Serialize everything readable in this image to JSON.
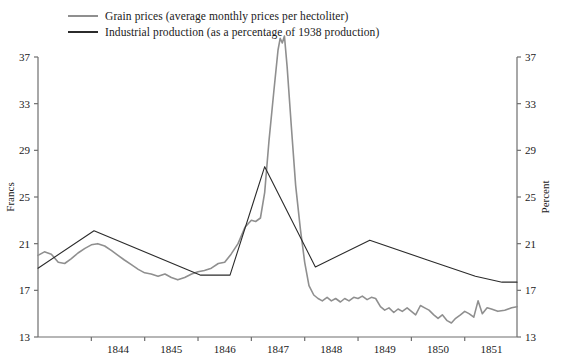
{
  "chart_data": {
    "type": "line",
    "title": "",
    "xlabel": "",
    "ylabel": "Francs",
    "y2label": "Percent",
    "xlim": [
      1843.0,
      1851.98
    ],
    "ylim": [
      13,
      37
    ],
    "y2lim": [
      13,
      37
    ],
    "grid": false,
    "legend_position": "top-left",
    "x_ticks": [
      1844,
      1845,
      1846,
      1847,
      1848,
      1849,
      1850,
      1851
    ],
    "x_tick_labels": [
      "1844",
      "1845",
      "1846",
      "1847",
      "1848",
      "1849",
      "1850",
      "1851"
    ],
    "y_ticks": [
      13,
      17,
      21,
      25,
      29,
      33,
      37
    ],
    "y_tick_labels": [
      "13",
      "17",
      "21",
      "25",
      "29",
      "33",
      "37"
    ],
    "y2_ticks": [
      13,
      17,
      21,
      25,
      29,
      33,
      37
    ],
    "y2_tick_labels": [
      "13",
      "17",
      "21",
      "25",
      "29",
      "33",
      "37"
    ],
    "series": [
      {
        "name": "Grain prices (average monthly prices per hectoliter)",
        "short_name": "grain-prices",
        "color": "#8f8f8f",
        "axis": "left",
        "unit": "francs",
        "points": [
          [
            1843.0,
            20.0
          ],
          [
            1843.12,
            20.3
          ],
          [
            1843.25,
            20.1
          ],
          [
            1843.38,
            19.4
          ],
          [
            1843.5,
            19.3
          ],
          [
            1843.62,
            19.7
          ],
          [
            1843.75,
            20.2
          ],
          [
            1843.88,
            20.6
          ],
          [
            1844.0,
            20.9
          ],
          [
            1844.12,
            21.0
          ],
          [
            1844.25,
            20.8
          ],
          [
            1844.38,
            20.4
          ],
          [
            1844.5,
            20.0
          ],
          [
            1844.62,
            19.6
          ],
          [
            1844.75,
            19.2
          ],
          [
            1844.88,
            18.8
          ],
          [
            1845.0,
            18.5
          ],
          [
            1845.12,
            18.4
          ],
          [
            1845.25,
            18.2
          ],
          [
            1845.38,
            18.4
          ],
          [
            1845.5,
            18.1
          ],
          [
            1845.62,
            17.9
          ],
          [
            1845.75,
            18.1
          ],
          [
            1845.88,
            18.4
          ],
          [
            1846.0,
            18.6
          ],
          [
            1846.12,
            18.7
          ],
          [
            1846.25,
            18.9
          ],
          [
            1846.38,
            19.3
          ],
          [
            1846.5,
            19.4
          ],
          [
            1846.62,
            20.1
          ],
          [
            1846.75,
            21.0
          ],
          [
            1846.88,
            22.4
          ],
          [
            1847.0,
            23.0
          ],
          [
            1847.08,
            22.9
          ],
          [
            1847.17,
            23.2
          ],
          [
            1847.25,
            25.4
          ],
          [
            1847.33,
            29.8
          ],
          [
            1847.42,
            34.0
          ],
          [
            1847.5,
            37.6
          ],
          [
            1847.54,
            38.6
          ],
          [
            1847.58,
            38.2
          ],
          [
            1847.62,
            38.8
          ],
          [
            1847.67,
            36.2
          ],
          [
            1847.75,
            31.0
          ],
          [
            1847.83,
            26.0
          ],
          [
            1847.92,
            22.2
          ],
          [
            1848.0,
            19.4
          ],
          [
            1848.08,
            17.4
          ],
          [
            1848.17,
            16.6
          ],
          [
            1848.25,
            16.3
          ],
          [
            1848.33,
            16.1
          ],
          [
            1848.42,
            16.4
          ],
          [
            1848.5,
            16.1
          ],
          [
            1848.58,
            16.3
          ],
          [
            1848.67,
            16.0
          ],
          [
            1848.75,
            16.3
          ],
          [
            1848.83,
            16.1
          ],
          [
            1848.92,
            16.4
          ],
          [
            1849.0,
            16.3
          ],
          [
            1849.08,
            16.5
          ],
          [
            1849.17,
            16.2
          ],
          [
            1849.25,
            16.4
          ],
          [
            1849.33,
            16.3
          ],
          [
            1849.42,
            15.6
          ],
          [
            1849.5,
            15.3
          ],
          [
            1849.58,
            15.5
          ],
          [
            1849.67,
            15.1
          ],
          [
            1849.75,
            15.4
          ],
          [
            1849.83,
            15.2
          ],
          [
            1849.92,
            15.5
          ],
          [
            1850.0,
            15.2
          ],
          [
            1850.08,
            14.9
          ],
          [
            1850.17,
            15.7
          ],
          [
            1850.25,
            15.5
          ],
          [
            1850.33,
            15.3
          ],
          [
            1850.42,
            14.9
          ],
          [
            1850.5,
            14.6
          ],
          [
            1850.58,
            14.9
          ],
          [
            1850.67,
            14.4
          ],
          [
            1850.75,
            14.2
          ],
          [
            1850.83,
            14.6
          ],
          [
            1850.92,
            14.9
          ],
          [
            1851.0,
            15.2
          ],
          [
            1851.08,
            15.0
          ],
          [
            1851.17,
            14.7
          ],
          [
            1851.25,
            16.1
          ],
          [
            1851.33,
            15.0
          ],
          [
            1851.42,
            15.5
          ],
          [
            1851.5,
            15.4
          ],
          [
            1851.62,
            15.2
          ],
          [
            1851.75,
            15.3
          ],
          [
            1851.88,
            15.5
          ],
          [
            1851.98,
            15.6
          ]
        ]
      },
      {
        "name": "Industrial production (as a percentage of 1938 production)",
        "short_name": "industrial-production",
        "color": "#2b2b2b",
        "axis": "right",
        "unit": "percent",
        "points": [
          [
            1843.0,
            18.9
          ],
          [
            1844.05,
            22.1
          ],
          [
            1846.05,
            18.3
          ],
          [
            1846.6,
            18.3
          ],
          [
            1847.25,
            27.6
          ],
          [
            1848.2,
            19.0
          ],
          [
            1849.22,
            21.3
          ],
          [
            1850.3,
            19.6
          ],
          [
            1851.2,
            18.2
          ],
          [
            1851.7,
            17.7
          ],
          [
            1851.98,
            17.7
          ]
        ]
      }
    ]
  },
  "legend": {
    "items": [
      {
        "label": "Grain prices (average monthly prices per hectoliter)",
        "color": "#8f8f8f"
      },
      {
        "label": "Industrial production (as a percentage of 1938 production)",
        "color": "#2b2b2b"
      }
    ]
  },
  "axes": {
    "left_title": "Francs",
    "right_title": "Percent",
    "axis_color": "#6e6e6e"
  }
}
